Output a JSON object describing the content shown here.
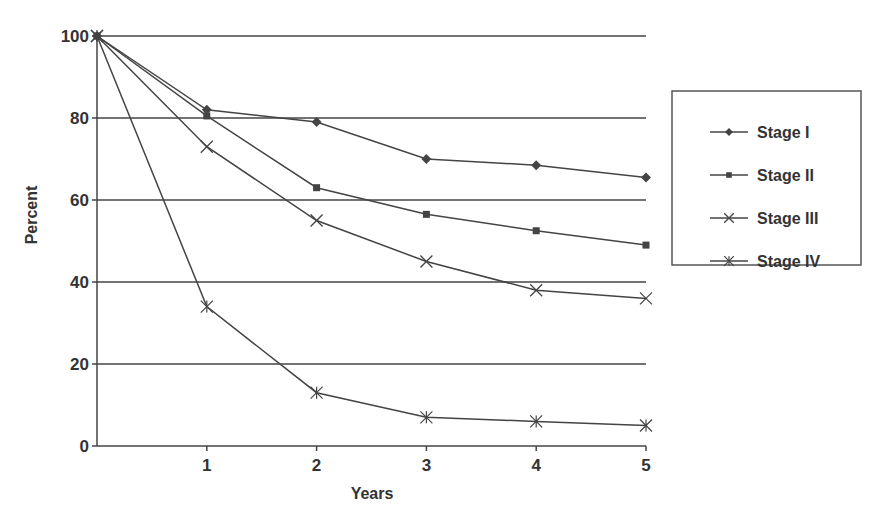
{
  "chart_data": {
    "type": "line",
    "title": "",
    "xlabel": "Years",
    "ylabel": "Percent",
    "x": [
      0,
      1,
      2,
      3,
      4,
      5
    ],
    "x_tick_labels": [
      "1",
      "2",
      "3",
      "4",
      "5"
    ],
    "y_tick_labels": [
      "0",
      "20",
      "40",
      "60",
      "80",
      "100"
    ],
    "ylim": [
      0,
      100
    ],
    "xlim": [
      0,
      5
    ],
    "grid": "horizontal",
    "legend_position": "right",
    "series": [
      {
        "name": "Stage I",
        "marker": "diamond",
        "values": [
          100,
          82,
          79,
          70,
          68.5,
          65.5
        ]
      },
      {
        "name": "Stage II",
        "marker": "square",
        "values": [
          100,
          80.5,
          63,
          56.5,
          52.5,
          49
        ]
      },
      {
        "name": "Stage III",
        "marker": "x",
        "values": [
          100,
          73,
          55,
          45,
          38,
          36
        ]
      },
      {
        "name": "Stage IV",
        "marker": "asterisk",
        "values": [
          100,
          34,
          13,
          7,
          6,
          5
        ]
      }
    ],
    "colors": {
      "line": "#444444",
      "text": "#333333",
      "grid": "#444444"
    }
  }
}
